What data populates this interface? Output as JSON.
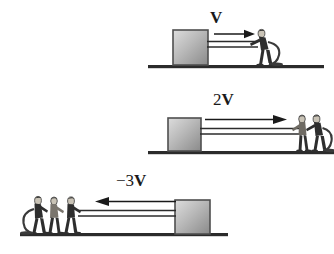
{
  "figure": {
    "width": 334,
    "height": 254,
    "background": "#ffffff",
    "ink": "#1a1a1a"
  },
  "colors": {
    "ground": "#2b2b2b",
    "block_border": "#4a4a4a",
    "block_light": "#d8d8d8",
    "block_dark": "#8e8e8e",
    "rod": "#2b2b2b",
    "arrow": "#1a1a1a",
    "person_body": "#2e2e2e",
    "person_skin": "#cfc9bd",
    "rope": "#3a3a3a"
  },
  "panels": [
    {
      "id": "panel-one-person",
      "label_prefix": "",
      "label_symbol": "V",
      "label_full": "V",
      "people_count": 1,
      "direction": "right",
      "block_side": "left",
      "arrow_length_px": 44,
      "speed_multiple": 1
    },
    {
      "id": "panel-two-people",
      "label_prefix": "2",
      "label_symbol": "V",
      "label_full": "2V",
      "people_count": 2,
      "direction": "right",
      "block_side": "left",
      "arrow_length_px": 122,
      "speed_multiple": 2
    },
    {
      "id": "panel-three-people",
      "label_prefix": "−3",
      "label_symbol": "V",
      "label_full": "−3V",
      "people_count": 3,
      "direction": "left",
      "block_side": "right",
      "arrow_length_px": 148,
      "speed_multiple": -3
    }
  ]
}
